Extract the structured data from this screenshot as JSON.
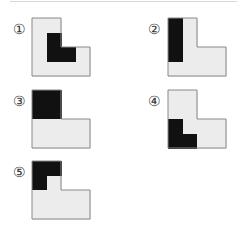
{
  "options": [
    {
      "label": "①",
      "x": 32,
      "y": 18,
      "lx": 13,
      "ly": 22,
      "dark": [
        [
          1,
          1
        ],
        [
          1,
          2
        ],
        [
          2,
          2
        ]
      ]
    },
    {
      "label": "②",
      "x": 168,
      "y": 18,
      "lx": 148,
      "ly": 22,
      "dark": [
        [
          0,
          0
        ],
        [
          0,
          1
        ],
        [
          0,
          2
        ]
      ]
    },
    {
      "label": "③",
      "x": 32,
      "y": 90,
      "lx": 13,
      "ly": 94,
      "dark": [
        [
          0,
          0
        ],
        [
          1,
          0
        ],
        [
          0,
          1
        ],
        [
          1,
          1
        ]
      ]
    },
    {
      "label": "④",
      "x": 168,
      "y": 90,
      "lx": 148,
      "ly": 94,
      "dark": [
        [
          0,
          2
        ],
        [
          0,
          3
        ],
        [
          1,
          3
        ]
      ]
    },
    {
      "label": "⑤",
      "x": 32,
      "y": 161,
      "lx": 13,
      "ly": 165,
      "dark": [
        [
          0,
          0
        ],
        [
          1,
          0
        ],
        [
          0,
          1
        ]
      ]
    }
  ],
  "colors": {
    "light": "#ececec",
    "dark": "#111111",
    "border": "#888888"
  }
}
